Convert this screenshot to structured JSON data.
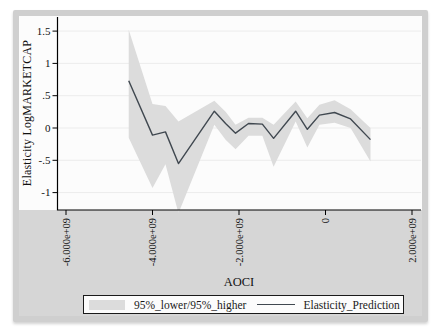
{
  "figure": {
    "y_axis_label": "Elasticity LogMARKETCAP",
    "x_axis_label": "AOCI",
    "legend": {
      "band_label": "95%_lower/95%_higher",
      "line_label": "Elasticity_Prediction"
    },
    "colors": {
      "band": "#dcdcdc",
      "line": "#404850",
      "frame_border": "#cfcfcf",
      "bottom_strip": "#d6d6d6",
      "grid": "#ececec",
      "axis": "#000000"
    }
  },
  "chart_data": {
    "type": "line",
    "title": "",
    "xlabel": "AOCI",
    "ylabel": "Elasticity LogMARKETCAP",
    "xlim": [
      -6200000000,
      2300000000
    ],
    "ylim": [
      -1.29,
      1.7
    ],
    "grid": "horizontal-only",
    "legend_position": "bottom",
    "x_ticks": {
      "values": [
        -6000000000,
        -4000000000,
        -2000000000,
        0,
        2000000000
      ],
      "labels": [
        "-6.000e+09",
        "-4.000e+09",
        "-2.000e+09",
        "0",
        "2.000e+09"
      ]
    },
    "y_ticks": {
      "values": [
        -1,
        -0.5,
        0,
        0.5,
        1,
        1.5
      ],
      "labels": [
        "-1",
        "-.5",
        "0",
        ".5",
        "1",
        "1.5"
      ]
    },
    "x": [
      -4550000000,
      -4000000000,
      -3700000000,
      -3400000000,
      -2570000000,
      -2310000000,
      -2080000000,
      -1780000000,
      -1460000000,
      -1200000000,
      -690000000,
      -420000000,
      -140000000,
      210000000,
      580000000,
      1040000000
    ],
    "series": [
      {
        "name": "Elasticity_Prediction",
        "values": [
          0.73,
          -0.11,
          -0.06,
          -0.55,
          0.26,
          0.07,
          -0.08,
          0.07,
          0.06,
          -0.16,
          0.26,
          -0.02,
          0.2,
          0.24,
          0.14,
          -0.18
        ]
      },
      {
        "name": "95%_higher",
        "values": [
          1.52,
          0.37,
          0.34,
          0.1,
          0.42,
          0.25,
          0.05,
          0.16,
          0.16,
          0.05,
          0.41,
          0.15,
          0.36,
          0.43,
          0.29,
          0.0
        ]
      },
      {
        "name": "95%_lower",
        "values": [
          -0.15,
          -0.93,
          -0.56,
          -1.32,
          0.05,
          -0.18,
          -0.33,
          -0.12,
          -0.12,
          -0.6,
          0.1,
          -0.3,
          0.05,
          0.08,
          0.0,
          -0.52
        ]
      }
    ]
  }
}
